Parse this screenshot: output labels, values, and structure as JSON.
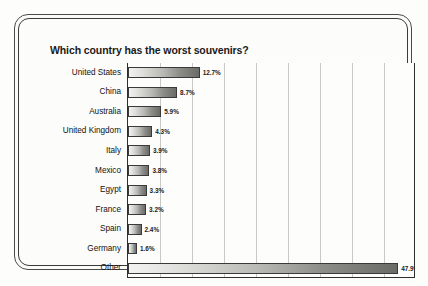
{
  "chart_data": {
    "type": "bar",
    "orientation": "horizontal",
    "title": "Which country has the worst souvenirs?",
    "xlabel": "",
    "ylabel": "",
    "categories": [
      "United States",
      "China",
      "Australia",
      "United Kingdom",
      "Italy",
      "Mexico",
      "Egypt",
      "France",
      "Spain",
      "Germany",
      "Other"
    ],
    "values": [
      12.7,
      8.7,
      5.9,
      4.3,
      3.9,
      3.8,
      3.3,
      3.2,
      2.4,
      1.6,
      47.9
    ],
    "value_labels": [
      "12.7%",
      "8.7%",
      "5.9%",
      "4.3%",
      "3.9%",
      "3.8%",
      "3.3%",
      "3.2%",
      "2.4%",
      "1.6%",
      "47.9%"
    ],
    "unit": "%",
    "xlim": [
      0,
      50
    ],
    "tick_labels": [],
    "gridlines": 8,
    "grid": true,
    "legend": null,
    "bar_color_start": "#f2f2f0",
    "bar_color_end": "#6a6a66",
    "bar_border_color": "#3a3a3a",
    "axis_color": "#2e2e2e",
    "grid_color": "#c9c9c4",
    "background": "#fcfcfa"
  }
}
